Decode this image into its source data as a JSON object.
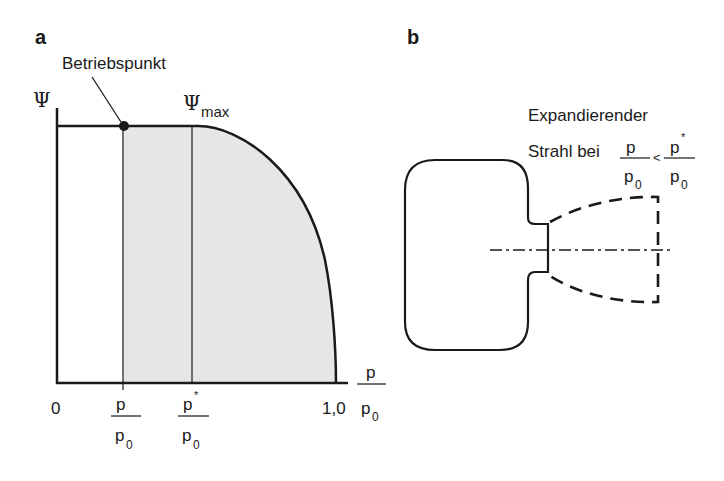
{
  "panel_a": {
    "label": "a",
    "y_axis_label": "Ψ",
    "annotation_operating_point": "Betriebspunkt",
    "psi_max_symbol": "Ψ",
    "psi_max_subscript": "max",
    "x_tick_zero": "0",
    "x_tick_one": "1,0",
    "x_tick_p_num": "p",
    "x_tick_p_den": "p",
    "x_tick_p_den_sub": "0",
    "x_tick_pstar_num": "p",
    "x_tick_pstar_sup": "*",
    "x_tick_pstar_den": "p",
    "x_tick_pstar_den_sub": "0",
    "x_axis_num": "p",
    "x_axis_den": "p",
    "x_axis_den_sub": "0"
  },
  "panel_b": {
    "label": "b",
    "caption_line1": "Expandierender",
    "caption_line2": "Strahl bei",
    "frac1_num": "p",
    "frac1_den": "p",
    "frac1_den_sub": "0",
    "comparison": "<",
    "frac2_num": "p",
    "frac2_sup": "*",
    "frac2_den": "p",
    "frac2_den_sub": "0"
  },
  "colors": {
    "line": "#1a1a1a",
    "fill": "#e6e6e6"
  }
}
